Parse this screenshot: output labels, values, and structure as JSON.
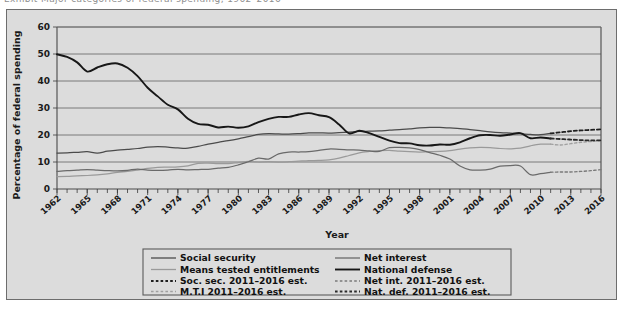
{
  "page": {
    "clipped_header": "Exhibit   Major categories of federal spending, 1962–2016",
    "background": "#dcdcdc",
    "border_color": "#6d6d6d"
  },
  "chart_data": {
    "type": "line",
    "title": "",
    "xlabel": "Year",
    "ylabel": "Percentage of federal spending",
    "xlim": [
      1962,
      2016
    ],
    "ylim": [
      0,
      60
    ],
    "ytick_step": 10,
    "yticks": [
      "0",
      "10",
      "20",
      "30",
      "40",
      "50",
      "60"
    ],
    "grid": true,
    "legend_position": "below-center",
    "xticks": [
      "1962",
      "1965",
      "1968",
      "1971",
      "1974",
      "1977",
      "1980",
      "1983",
      "1986",
      "1989",
      "1992",
      "1995",
      "1998",
      "2001",
      "2004",
      "2007",
      "2010",
      "2013",
      "2016"
    ],
    "x": [
      1962,
      1963,
      1964,
      1965,
      1966,
      1967,
      1968,
      1969,
      1970,
      1971,
      1972,
      1973,
      1974,
      1975,
      1976,
      1977,
      1978,
      1979,
      1980,
      1981,
      1982,
      1983,
      1984,
      1985,
      1986,
      1987,
      1988,
      1989,
      1990,
      1991,
      1992,
      1993,
      1994,
      1995,
      1996,
      1997,
      1998,
      1999,
      2000,
      2001,
      2002,
      2003,
      2004,
      2005,
      2006,
      2007,
      2008,
      2009,
      2010,
      2011,
      2012,
      2013,
      2014,
      2015,
      2016
    ],
    "colors": {
      "social_security": "#4b4b4b",
      "means_tested": "#9a9a9a",
      "net_interest": "#6a6a6a",
      "national_defense": "#171717",
      "projection_soc_sec": "#1f1f1f",
      "projection_mti": "#a0a0a0",
      "projection_net_int": "#7a7a7a",
      "projection_nat_def": "#2a2a2a"
    },
    "series": [
      {
        "name": "Social security",
        "key": "social_security",
        "style": "solid",
        "values": [
          13.3,
          13.4,
          13.6,
          13.8,
          13.3,
          14.0,
          14.4,
          14.7,
          15.0,
          15.5,
          15.7,
          15.5,
          15.2,
          15.1,
          15.8,
          16.6,
          17.3,
          17.9,
          18.6,
          19.4,
          20.2,
          20.5,
          20.4,
          20.3,
          20.5,
          20.8,
          20.8,
          20.7,
          20.9,
          21.1,
          21.3,
          21.4,
          21.5,
          21.8,
          22.0,
          22.3,
          22.6,
          22.8,
          22.8,
          22.6,
          22.4,
          22.0,
          21.6,
          21.2,
          20.9,
          20.7,
          20.5,
          20.2,
          20.1,
          20.6,
          21.0,
          21.4,
          21.7,
          21.9,
          22.1
        ]
      },
      {
        "name": "Means tested entitlements",
        "key": "means_tested",
        "style": "solid",
        "values": [
          4.6,
          4.7,
          4.9,
          5.0,
          5.2,
          5.6,
          6.2,
          6.5,
          7.0,
          7.6,
          8.0,
          8.1,
          8.2,
          8.6,
          9.5,
          9.6,
          9.4,
          9.4,
          9.8,
          10.2,
          10.0,
          10.1,
          10.0,
          10.1,
          10.3,
          10.5,
          10.6,
          10.8,
          11.4,
          12.4,
          13.4,
          13.9,
          14.2,
          14.3,
          14.0,
          13.8,
          13.7,
          13.8,
          13.9,
          14.2,
          14.8,
          15.2,
          15.4,
          15.3,
          15.0,
          14.9,
          15.1,
          16.0,
          16.6,
          16.6,
          16.3,
          16.8,
          17.3,
          17.6,
          17.9
        ]
      },
      {
        "name": "Net interest",
        "key": "net_interest",
        "style": "solid",
        "values": [
          6.5,
          6.8,
          7.0,
          7.2,
          7.0,
          6.8,
          6.7,
          6.9,
          7.4,
          7.0,
          6.9,
          7.0,
          7.3,
          7.1,
          7.2,
          7.3,
          7.7,
          8.0,
          8.9,
          10.1,
          11.4,
          11.1,
          13.0,
          13.7,
          13.7,
          13.8,
          14.3,
          14.8,
          14.7,
          14.5,
          14.4,
          14.1,
          13.9,
          15.3,
          15.4,
          15.2,
          14.6,
          13.5,
          12.5,
          11.1,
          8.5,
          7.1,
          7.0,
          7.4,
          8.5,
          8.7,
          8.5,
          5.3,
          5.7,
          6.2,
          6.3,
          6.3,
          6.5,
          6.8,
          7.2
        ]
      },
      {
        "name": "National defense",
        "key": "national_defense",
        "style": "solid",
        "values": [
          49.9,
          48.9,
          46.9,
          43.5,
          45.0,
          46.2,
          46.5,
          44.9,
          41.8,
          37.5,
          34.3,
          31.2,
          29.5,
          26.0,
          24.1,
          23.8,
          22.8,
          23.1,
          22.7,
          23.2,
          24.8,
          26.0,
          26.7,
          26.7,
          27.6,
          28.1,
          27.3,
          26.6,
          23.9,
          20.6,
          21.6,
          20.7,
          19.3,
          17.9,
          17.0,
          16.9,
          16.2,
          16.1,
          16.5,
          16.4,
          17.3,
          18.8,
          19.9,
          20.0,
          19.7,
          20.2,
          20.7,
          18.8,
          19.1,
          18.7,
          18.5,
          18.3,
          18.1,
          18.0,
          18.0
        ]
      }
    ],
    "projections": [
      {
        "name": "Soc. sec. 2011–2016 est.",
        "key": "projection_soc_sec",
        "style": "dashed",
        "x": [
          2011,
          2012,
          2013,
          2014,
          2015,
          2016
        ],
        "values": [
          20.6,
          21.0,
          21.4,
          21.7,
          21.9,
          22.1
        ]
      },
      {
        "name": "M.T.I 2011–2016 est.",
        "key": "projection_mti",
        "style": "dashed",
        "x": [
          2011,
          2012,
          2013,
          2014,
          2015,
          2016
        ],
        "values": [
          16.6,
          16.3,
          16.8,
          17.3,
          17.6,
          17.9
        ]
      },
      {
        "name": "Net int. 2011–2016 est.",
        "key": "projection_net_int",
        "style": "dashed",
        "x": [
          2011,
          2012,
          2013,
          2014,
          2015,
          2016
        ],
        "values": [
          6.2,
          6.3,
          6.3,
          6.5,
          6.8,
          7.2
        ]
      },
      {
        "name": "Nat. def. 2011–2016 est.",
        "key": "projection_nat_def",
        "style": "dashed",
        "x": [
          2011,
          2012,
          2013,
          2014,
          2015,
          2016
        ],
        "values": [
          18.7,
          18.5,
          18.3,
          18.1,
          18.0,
          18.0
        ]
      }
    ]
  },
  "legend": {
    "entries": [
      {
        "label": "Social security",
        "key": "social_security",
        "style": "solid",
        "col": 0,
        "row": 0
      },
      {
        "label": "Net interest",
        "key": "net_interest",
        "style": "solid",
        "col": 1,
        "row": 0
      },
      {
        "label": "Means tested entitlements",
        "key": "means_tested",
        "style": "solid",
        "col": 0,
        "row": 1
      },
      {
        "label": "National defense",
        "key": "national_defense",
        "style": "solid",
        "col": 1,
        "row": 1
      },
      {
        "label": "Soc. sec. 2011–2016 est.",
        "key": "projection_soc_sec",
        "style": "dashed",
        "col": 0,
        "row": 2
      },
      {
        "label": "Net int. 2011–2016 est.",
        "key": "projection_net_int",
        "style": "dashed",
        "col": 1,
        "row": 2
      },
      {
        "label": "M.T.I 2011–2016 est.",
        "key": "projection_mti",
        "style": "dashed",
        "col": 0,
        "row": 3
      },
      {
        "label": "Nat. def. 2011–2016 est.",
        "key": "projection_nat_def",
        "style": "dashed",
        "col": 1,
        "row": 3
      }
    ]
  }
}
